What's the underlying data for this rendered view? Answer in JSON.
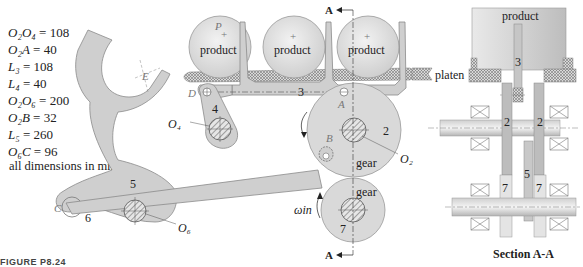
{
  "dimensions": [
    {
      "lhs": "O₂O₄",
      "value": "108"
    },
    {
      "lhs": "O₂A",
      "value": "40"
    },
    {
      "lhs": "L₃",
      "value": "108"
    },
    {
      "lhs": "L₄",
      "value": "40"
    },
    {
      "lhs": "O₂O₆",
      "value": "200"
    },
    {
      "lhs": "O₂B",
      "value": "32"
    },
    {
      "lhs": "L₅",
      "value": "260"
    },
    {
      "lhs": "O₆C",
      "value": "96"
    }
  ],
  "units_note": "all dimensions in mm",
  "caption": "FIGURE P8.24",
  "labels": {
    "product": "product",
    "gear": "gear",
    "platen": "platen",
    "section_title": "Section A-A",
    "section_marker": "A",
    "point_P": "P",
    "point_E": "E",
    "point_D": "D",
    "point_A": "A",
    "point_B": "B",
    "point_C": "C",
    "pivot_O2": "O₂",
    "pivot_O4": "O₄",
    "pivot_O6": "O₆",
    "omega_in": "ωin",
    "link_2": "2",
    "link_3": "3",
    "link_4": "4",
    "link_5": "5",
    "link_6": "6",
    "link_7": "7"
  },
  "colors": {
    "link_fill": "#cfcfcf",
    "link_stroke": "#8a8a8a",
    "product_fill": "#dedede",
    "hatch": "#555555",
    "text": "#222222",
    "label_gray": "#777777"
  }
}
